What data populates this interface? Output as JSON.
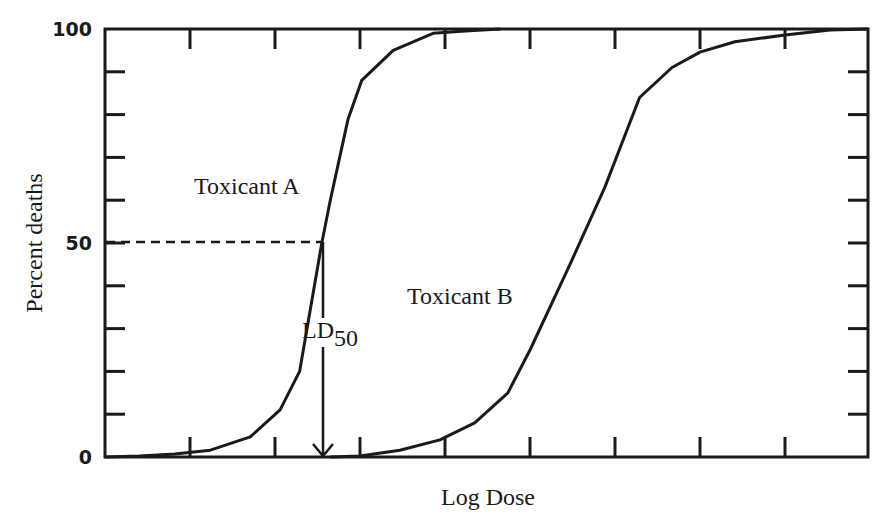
{
  "chart_data": {
    "type": "line",
    "title": "",
    "xlabel": "Log Dose",
    "ylabel": "Percent deaths",
    "ylim": [
      0,
      100
    ],
    "xlim": [
      0,
      8.98
    ],
    "y_tick_labels": [
      "0",
      "50",
      "100"
    ],
    "y_minor_ticks": [
      10,
      20,
      30,
      40,
      60,
      70,
      80,
      90
    ],
    "x_ticks": [
      1,
      2,
      3,
      4,
      5,
      6,
      7,
      8
    ],
    "x_tick_labels": [],
    "grid": false,
    "legend": null,
    "series": [
      {
        "name": "Toxicant A",
        "x": [
          0.0,
          0.41,
          0.82,
          1.24,
          1.71,
          2.06,
          2.29,
          2.55,
          2.65,
          2.86,
          3.02,
          3.39,
          3.86,
          4.24,
          4.65
        ],
        "y": [
          0,
          0.2,
          0.7,
          1.6,
          4.7,
          11,
          20,
          50,
          60,
          79,
          88,
          95,
          99,
          99.5,
          100
        ]
      },
      {
        "name": "Toxicant B",
        "x": [
          2.65,
          3.0,
          3.47,
          3.94,
          4.35,
          4.74,
          5.0,
          5.47,
          5.88,
          6.29,
          6.67,
          7.0,
          7.41,
          8.0,
          8.53,
          8.98
        ],
        "y": [
          0,
          0.2,
          1.6,
          4,
          8,
          15,
          25,
          45,
          63,
          84,
          91,
          94.6,
          97,
          98.6,
          99.8,
          100
        ]
      }
    ],
    "annotations": [
      {
        "text": "Toxicant A",
        "target_series": "Toxicant A"
      },
      {
        "text": "Toxicant B",
        "target_series": "Toxicant B"
      },
      {
        "text": "LD",
        "subscript": "50",
        "x": 2.55,
        "y_from": 50,
        "y_to": 0,
        "type": "arrow-down"
      },
      {
        "type": "dashed-line",
        "x_from": 0,
        "x_to": 2.55,
        "y": 50
      }
    ]
  },
  "labels": {
    "y_axis": "Percent deaths",
    "x_axis": "Log Dose",
    "y_100": "100",
    "y_50": "50",
    "y_0": "0",
    "toxicant_a": "Toxicant A",
    "toxicant_b": "Toxicant B",
    "ld": "LD",
    "ld_sub": "50"
  },
  "colors": {
    "line": "#1a1a1a",
    "background": "#ffffff"
  }
}
